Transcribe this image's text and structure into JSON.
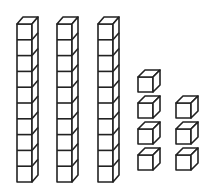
{
  "diagram": {
    "title": "Base-ten blocks",
    "represented_number": 37,
    "stroke_color": "#222222",
    "fill_color": "#ffffff",
    "rods": [
      {
        "label": "ten-rod-1",
        "x": 17,
        "cubes": 10
      },
      {
        "label": "ten-rod-2",
        "x": 57,
        "cubes": 10
      },
      {
        "label": "ten-rod-3",
        "x": 98,
        "cubes": 10
      }
    ],
    "rod_geometry": {
      "bottom": 182,
      "cube_size": 15.8,
      "width": 15,
      "depth_dx": 6,
      "depth_dy": 7
    },
    "units": [
      {
        "label": "unit-cube-1",
        "x": 138,
        "y": 77
      },
      {
        "label": "unit-cube-2",
        "x": 138,
        "y": 103
      },
      {
        "label": "unit-cube-3",
        "x": 138,
        "y": 129
      },
      {
        "label": "unit-cube-4",
        "x": 138,
        "y": 155
      },
      {
        "label": "unit-cube-5",
        "x": 176,
        "y": 103
      },
      {
        "label": "unit-cube-6",
        "x": 176,
        "y": 129
      },
      {
        "label": "unit-cube-7",
        "x": 176,
        "y": 155
      }
    ],
    "unit_geometry": {
      "size": 15,
      "depth_dx": 7,
      "depth_dy": 7
    },
    "counts": {
      "tens": 3,
      "ones": 7
    }
  }
}
